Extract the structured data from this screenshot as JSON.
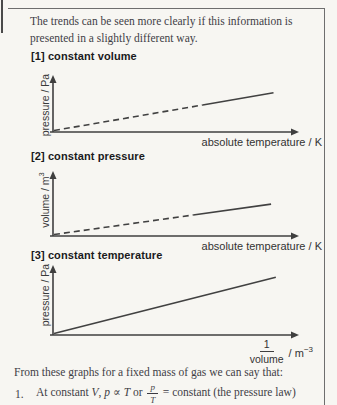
{
  "intro": {
    "line1": "The trends can be seen more clearly if this information is",
    "line2": "presented in a slightly different way."
  },
  "chart_data": [
    {
      "type": "line",
      "heading": "[1] constant volume",
      "ylabel_base": "pressure / Pa",
      "ylabel_sup": "",
      "xlabel": "absolute temperature / K",
      "grid": false,
      "ticks": "none",
      "origin": [
        0,
        0
      ],
      "series": [
        {
          "name": "extrapolated region",
          "style": "dashed",
          "points_frac": [
            [
              0,
              0
            ],
            [
              0.63,
              0.5
            ]
          ]
        },
        {
          "name": "measured region",
          "style": "solid",
          "points_frac": [
            [
              0.63,
              0.5
            ],
            [
              0.93,
              0.74
            ]
          ]
        }
      ]
    },
    {
      "type": "line",
      "heading": "[2] constant pressure",
      "ylabel_base": "volume / m",
      "ylabel_sup": "3",
      "xlabel": "absolute temperature / K",
      "grid": false,
      "ticks": "none",
      "origin": [
        0,
        0
      ],
      "series": [
        {
          "name": "extrapolated region",
          "style": "dashed",
          "points_frac": [
            [
              0,
              0
            ],
            [
              0.59,
              0.33
            ]
          ]
        },
        {
          "name": "measured region",
          "style": "solid",
          "points_frac": [
            [
              0.59,
              0.33
            ],
            [
              0.92,
              0.515
            ]
          ]
        }
      ]
    },
    {
      "type": "line",
      "heading": "[3] constant temperature",
      "ylabel_base": "pressure / Pa",
      "ylabel_sup": "",
      "xlabel_frac_num": "1",
      "xlabel_frac_den": "volume",
      "xlabel_unit_base": " / m",
      "xlabel_unit_sup": "−3",
      "grid": false,
      "ticks": "none",
      "origin": [
        0,
        0
      ],
      "series": [
        {
          "name": "measured region",
          "style": "solid",
          "points_frac": [
            [
              0,
              0
            ],
            [
              0.94,
              0.88
            ]
          ]
        }
      ]
    }
  ],
  "outro": {
    "lead": "From these graphs for a fixed mass of gas we can say that:",
    "item1": {
      "num": "1.",
      "t1": "At constant ",
      "v": "V",
      "t2": ", ",
      "p": "p",
      "t3": " ∝ ",
      "T": "T",
      "t4": " or ",
      "frac_num": "p",
      "frac_den": "T",
      "t5": " = constant (the pressure law)"
    }
  },
  "colors": {
    "background": "#f7f6f2",
    "ink": "#3b3a42",
    "heading": "#1a1a1c",
    "graph_line": "#414141",
    "frame": "#6e6e6e"
  }
}
